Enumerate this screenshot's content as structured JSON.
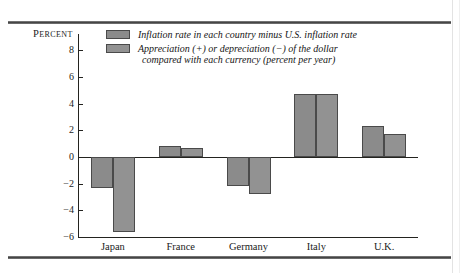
{
  "chart_data": {
    "type": "bar",
    "title": "",
    "subtitle": "",
    "xlabel": "",
    "ylabel": "Percent",
    "ylim": [
      -6,
      8
    ],
    "yticks": [
      8,
      6,
      4,
      2,
      0,
      -2,
      -4,
      -6
    ],
    "ytick_labels": [
      "8",
      "6",
      "4",
      "2",
      "0",
      "−2",
      "−4",
      "−6"
    ],
    "grid": false,
    "legend_position": "top-left",
    "categories": [
      "Japan",
      "France",
      "Germany",
      "Italy",
      "U.K."
    ],
    "series": [
      {
        "name": "Inflation rate in each country minus U.S. inflation rate",
        "values": [
          -2.35,
          0.85,
          -2.2,
          4.7,
          2.3
        ]
      },
      {
        "name": "Appreciation (+) or depreciation (−) of the dollar compared with each currency (percent per year)",
        "values": [
          -5.6,
          0.65,
          -2.75,
          4.7,
          1.7
        ]
      }
    ],
    "annotations": []
  },
  "axis": {
    "y_title_small_caps_first": "P",
    "y_title_rest": "ERCENT",
    "ticks": [
      {
        "label": "8",
        "value": 8
      },
      {
        "label": "6",
        "value": 6
      },
      {
        "label": "4",
        "value": 4
      },
      {
        "label": "2",
        "value": 2
      },
      {
        "label": "0",
        "value": 0
      },
      {
        "label": "−2",
        "value": -2
      },
      {
        "label": "−4",
        "value": -4
      },
      {
        "label": "−6",
        "value": -6
      }
    ]
  },
  "legend": {
    "entries": [
      {
        "swatch": "series-0-swatch",
        "line1": "Inflation rate in each country minus U.S. inflation rate",
        "line2": ""
      },
      {
        "swatch": "series-1-swatch",
        "line1": "Appreciation (+) or depreciation (−) of the dollar",
        "line2": "compared with each currency (percent per year)"
      }
    ]
  },
  "category_labels": [
    "Japan",
    "France",
    "Germany",
    "Italy",
    "U.K."
  ],
  "colors": {
    "series_0": "#8b8b8b",
    "series_1": "#929292",
    "bar_border": "#4a4a4a",
    "axis": "#23231f",
    "text": "#1b1b1b",
    "rule": "#3a3a3a",
    "background": "#ffffff"
  }
}
